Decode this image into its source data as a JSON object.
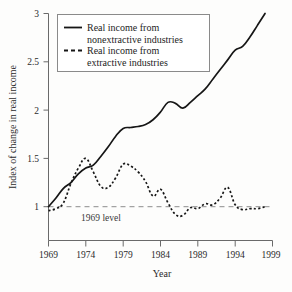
{
  "chart_data": {
    "type": "line",
    "title": "",
    "xlabel": "Year",
    "ylabel": "Index of change in real income",
    "xlim": [
      1969,
      1999
    ],
    "ylim": [
      0.78,
      3.0
    ],
    "grid": false,
    "legend_position": "top-left",
    "xticks": [
      "1969",
      "1974",
      "1979",
      "1984",
      "1989",
      "1994",
      "1999"
    ],
    "xtick_values": [
      1969,
      1974,
      1979,
      1984,
      1989,
      1994,
      1999
    ],
    "yticks": [
      "1",
      "1.5",
      "2",
      "2.5",
      "3"
    ],
    "ytick_values": [
      1,
      1.5,
      2,
      2.5,
      3
    ],
    "annotations": [
      {
        "text": "1969 level",
        "x": 1973.4,
        "y": 0.93,
        "kind": "reference-line-label"
      }
    ],
    "reference_lines": [
      {
        "name": "1969 level",
        "y": 1.0,
        "style": "dashed",
        "color": "#8d8d8d"
      }
    ],
    "series": [
      {
        "name": "Real income from nonextractive industries",
        "legend_label_line1": "Real income from",
        "legend_label_line2": "nonextractive industries",
        "style": "solid",
        "color": "#161616",
        "x": [
          1969,
          1970,
          1971,
          1972,
          1973,
          1974,
          1975,
          1976,
          1977,
          1978,
          1979,
          1980,
          1981,
          1982,
          1983,
          1984,
          1985,
          1986,
          1987,
          1988,
          1989,
          1990,
          1991,
          1992,
          1993,
          1994,
          1995,
          1996,
          1997,
          1998
        ],
        "values": [
          1.0,
          1.09,
          1.19,
          1.25,
          1.34,
          1.4,
          1.43,
          1.52,
          1.62,
          1.73,
          1.81,
          1.82,
          1.83,
          1.85,
          1.9,
          1.98,
          2.08,
          2.07,
          2.02,
          2.08,
          2.15,
          2.22,
          2.32,
          2.42,
          2.52,
          2.62,
          2.66,
          2.76,
          2.88,
          3.0
        ]
      },
      {
        "name": "Real income from extractive industries",
        "legend_label_line1": "Real income from",
        "legend_label_line2": "extractive industries",
        "style": "dashed",
        "color": "#161616",
        "x": [
          1969,
          1970,
          1971,
          1972,
          1973,
          1974,
          1975,
          1976,
          1977,
          1978,
          1979,
          1980,
          1981,
          1982,
          1983,
          1984,
          1985,
          1986,
          1987,
          1988,
          1989,
          1990,
          1991,
          1992,
          1993,
          1994,
          1995,
          1996,
          1997,
          1998
        ],
        "values": [
          0.96,
          0.98,
          1.04,
          1.24,
          1.4,
          1.5,
          1.36,
          1.21,
          1.2,
          1.3,
          1.44,
          1.42,
          1.36,
          1.26,
          1.11,
          1.18,
          1.04,
          0.92,
          0.91,
          0.99,
          0.98,
          1.03,
          1.02,
          1.09,
          1.2,
          1.02,
          0.97,
          0.98,
          0.98,
          1.0
        ]
      }
    ]
  },
  "legend": {
    "entries": [
      {
        "marker": "solid-line-swatch",
        "line1": "Real income from",
        "line2": "nonextractive industries"
      },
      {
        "marker": "dashed-line-swatch",
        "line1": "Real income from",
        "line2": "extractive industries"
      }
    ]
  }
}
